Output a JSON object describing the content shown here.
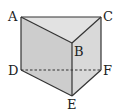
{
  "figure": {
    "type": "triangular-prism",
    "vertices": {
      "A": {
        "label": "A",
        "x": 21,
        "y": 17
      },
      "B": {
        "label": "B",
        "x": 72,
        "y": 43
      },
      "C": {
        "label": "C",
        "x": 101,
        "y": 17
      },
      "D": {
        "label": "D",
        "x": 21,
        "y": 70
      },
      "E": {
        "label": "E",
        "x": 72,
        "y": 96
      },
      "F": {
        "label": "F",
        "x": 101,
        "y": 70
      }
    },
    "hidden_edges": [
      "DF"
    ],
    "colors": {
      "top_face": "#e2e2e2",
      "front_face": "#cdcdcd",
      "right_face": "#d9d9d9",
      "edge": "#333333"
    }
  }
}
